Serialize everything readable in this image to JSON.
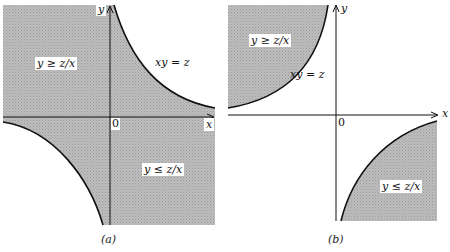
{
  "figure": {
    "panels": [
      {
        "id": "a",
        "caption": "(a)",
        "axis_x_label": "x",
        "axis_y_label": "y",
        "origin_label": "0",
        "curve_label": "xy = z",
        "region_upper_label": "y ≥ z/x",
        "region_lower_label": "y ≤ z/x"
      },
      {
        "id": "b",
        "caption": "(b)",
        "axis_x_label": "x",
        "axis_y_label": "y",
        "origin_label": "0",
        "curve_label": "xy = z",
        "region_upper_label": "y ≥ z/x",
        "region_lower_label": "y ≤ z/x"
      }
    ],
    "colors": {
      "shade": "#b4b4b4",
      "line": "#111111",
      "background": "#ffffff"
    }
  }
}
